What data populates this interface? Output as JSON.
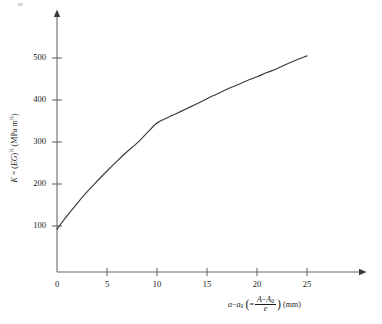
{
  "figure": {
    "background_color": "#ffffff",
    "ink_color": "#3a3a3a",
    "text_color": "#1a1a1a"
  },
  "y_axis_title": {
    "symbol": "K",
    "equals": " = (",
    "eg": "EG",
    "close": ")",
    "exp": "½",
    "units": " (MPa m",
    "units_exp": "½",
    "units_close": ")",
    "full_text": "K = (EG)½ (MPa m½)"
  },
  "x_axis_title": {
    "a": "a",
    "minus": "−",
    "a0_base": "a",
    "a0_sub": "0",
    "equals": "=",
    "num_A": "A",
    "num_minus": "−",
    "num_A0_base": "A",
    "num_A0_sub": "0",
    "den": "e",
    "units": "(mm)",
    "full_text": "a − a₀ ( = (A − A₀)/e ) (mm)"
  },
  "chart_data": {
    "type": "line",
    "title": "",
    "subtitle": "",
    "xlabel": "a − a₀ ( = (A − A₀)/e ) (mm)",
    "ylabel": "K = (EG)½ (MPa m½)",
    "xlim": [
      0,
      27.5
    ],
    "ylim": [
      0,
      560
    ],
    "xticks": [
      0,
      5,
      10,
      15,
      20,
      25
    ],
    "xtick_labels": [
      "0",
      "5",
      "10",
      "15",
      "20",
      "25"
    ],
    "yticks": [
      100,
      200,
      300,
      400,
      500
    ],
    "ytick_labels": [
      "100",
      "200",
      "300",
      "400",
      "500"
    ],
    "grid": false,
    "legend": null,
    "legend_position": "none",
    "axes_style": "arrow-terminated open axes",
    "series": [
      {
        "name": "K vs crack extension",
        "color": "#3a3a3a",
        "line_width": 1,
        "x": [
          0,
          1,
          2,
          3,
          4,
          5,
          6,
          7,
          8,
          9,
          10,
          11,
          12,
          13,
          14,
          15,
          16,
          17,
          18,
          19,
          20,
          21,
          22,
          23,
          24,
          25
        ],
        "y": [
          100,
          131,
          160,
          187,
          212,
          236,
          259,
          281,
          301,
          325,
          348,
          360,
          371,
          382,
          393,
          405,
          416,
          427,
          437,
          447,
          456,
          466,
          475,
          486,
          496,
          505
        ]
      }
    ]
  }
}
